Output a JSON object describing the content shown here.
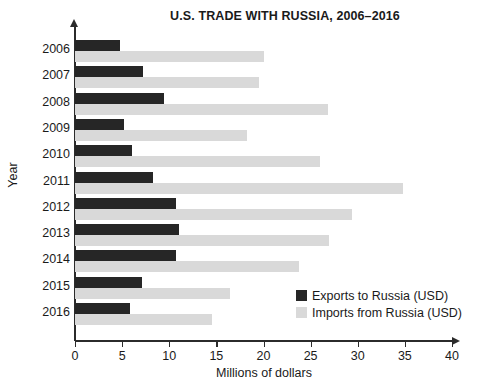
{
  "chart_data": {
    "type": "bar",
    "orientation": "horizontal",
    "title": "U.S. TRADE WITH RUSSIA, 2006–2016",
    "xlabel": "Millions of dollars",
    "ylabel": "Year",
    "categories": [
      "2006",
      "2007",
      "2008",
      "2009",
      "2010",
      "2011",
      "2012",
      "2013",
      "2014",
      "2015",
      "2016"
    ],
    "series": [
      {
        "name": "Exports to Russia (USD)",
        "color": "#262626",
        "values": [
          4.8,
          7.2,
          9.4,
          5.2,
          6.0,
          8.3,
          10.7,
          11.0,
          10.7,
          7.1,
          5.8
        ]
      },
      {
        "name": "Imports from Russia (USD)",
        "color": "#d9d9d9",
        "values": [
          20.0,
          19.5,
          26.8,
          18.3,
          26.0,
          34.8,
          29.4,
          27.0,
          23.8,
          16.4,
          14.5
        ]
      }
    ],
    "xlim": [
      0,
      40
    ],
    "xticks": [
      "0",
      "5",
      "10",
      "15",
      "20",
      "25",
      "30",
      "35",
      "40"
    ],
    "grid": false,
    "legend_position": "inside-bottom-right"
  }
}
